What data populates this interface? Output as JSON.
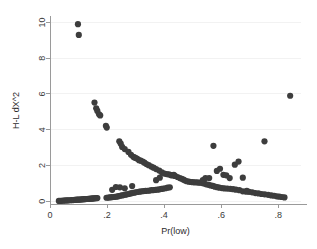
{
  "chart_data": {
    "type": "scatter",
    "title": "",
    "xlabel": "Pr(low)",
    "ylabel": "H-L dX^2",
    "xlim": [
      0,
      0.88
    ],
    "ylim": [
      -0.15,
      10.3
    ],
    "xticks": [
      0,
      0.2,
      0.4,
      0.6,
      0.8
    ],
    "xticklabels": [
      "0",
      ".2",
      ".4",
      ".6",
      ".8"
    ],
    "yticks": [
      0,
      2,
      4,
      6,
      8,
      10
    ],
    "yticklabels": [
      "0",
      "2",
      "4",
      "6",
      "8",
      "10"
    ],
    "grid": "faint-horizontal",
    "legend": "none",
    "marker_color": "#3d3d3d",
    "marker_size": 3.1,
    "series": [
      {
        "name": "H-L dX^2 vs Pr(low)",
        "points": [
          [
            0.098,
            9.9
          ],
          [
            0.101,
            9.3
          ],
          [
            0.842,
            5.9
          ],
          [
            0.156,
            5.52
          ],
          [
            0.162,
            5.2
          ],
          [
            0.166,
            5.05
          ],
          [
            0.172,
            4.86
          ],
          [
            0.176,
            4.8
          ],
          [
            0.196,
            4.22
          ],
          [
            0.199,
            4.12
          ],
          [
            0.243,
            3.35
          ],
          [
            0.248,
            3.22
          ],
          [
            0.253,
            3.04
          ],
          [
            0.262,
            2.92
          ],
          [
            0.275,
            2.76
          ],
          [
            0.284,
            2.6
          ],
          [
            0.292,
            2.49
          ],
          [
            0.296,
            2.45
          ],
          [
            0.301,
            2.42
          ],
          [
            0.306,
            2.38
          ],
          [
            0.312,
            2.3
          ],
          [
            0.318,
            2.27
          ],
          [
            0.325,
            2.22
          ],
          [
            0.331,
            2.16
          ],
          [
            0.338,
            2.08
          ],
          [
            0.346,
            2.02
          ],
          [
            0.355,
            1.94
          ],
          [
            0.363,
            1.88
          ],
          [
            0.372,
            1.8
          ],
          [
            0.383,
            1.72
          ],
          [
            0.392,
            1.62
          ],
          [
            0.401,
            1.55
          ],
          [
            0.409,
            1.52
          ],
          [
            0.417,
            1.5
          ],
          [
            0.424,
            1.47
          ],
          [
            0.431,
            1.45
          ],
          [
            0.438,
            1.42
          ],
          [
            0.447,
            1.36
          ],
          [
            0.455,
            1.3
          ],
          [
            0.462,
            1.26
          ],
          [
            0.468,
            1.21
          ],
          [
            0.474,
            1.16
          ],
          [
            0.48,
            1.12
          ],
          [
            0.487,
            1.1
          ],
          [
            0.494,
            1.08
          ],
          [
            0.5,
            1.07
          ],
          [
            0.507,
            1.06
          ],
          [
            0.514,
            1.06
          ],
          [
            0.52,
            1.05
          ],
          [
            0.527,
            1.04
          ],
          [
            0.534,
            1.02
          ],
          [
            0.541,
            0.99
          ],
          [
            0.548,
            0.95
          ],
          [
            0.556,
            0.92
          ],
          [
            0.563,
            0.89
          ],
          [
            0.571,
            0.86
          ],
          [
            0.578,
            0.82
          ],
          [
            0.586,
            0.79
          ],
          [
            0.594,
            0.76
          ],
          [
            0.603,
            0.74
          ],
          [
            0.612,
            0.72
          ],
          [
            0.622,
            0.71
          ],
          [
            0.632,
            0.7
          ],
          [
            0.642,
            0.68
          ],
          [
            0.652,
            0.65
          ],
          [
            0.664,
            0.62
          ],
          [
            0.676,
            0.56
          ],
          [
            0.688,
            0.54
          ],
          [
            0.698,
            0.53
          ],
          [
            0.709,
            0.5
          ],
          [
            0.72,
            0.46
          ],
          [
            0.731,
            0.44
          ],
          [
            0.742,
            0.41
          ],
          [
            0.753,
            0.39
          ],
          [
            0.765,
            0.36
          ],
          [
            0.776,
            0.33
          ],
          [
            0.786,
            0.31
          ],
          [
            0.795,
            0.28
          ],
          [
            0.804,
            0.26
          ],
          [
            0.813,
            0.24
          ],
          [
            0.822,
            0.22
          ],
          [
            0.031,
            0.02
          ],
          [
            0.036,
            0.03
          ],
          [
            0.041,
            0.03
          ],
          [
            0.046,
            0.04
          ],
          [
            0.051,
            0.04
          ],
          [
            0.056,
            0.05
          ],
          [
            0.061,
            0.05
          ],
          [
            0.066,
            0.06
          ],
          [
            0.071,
            0.06
          ],
          [
            0.076,
            0.07
          ],
          [
            0.081,
            0.07
          ],
          [
            0.086,
            0.08
          ],
          [
            0.09,
            0.08
          ],
          [
            0.094,
            0.09
          ],
          [
            0.098,
            0.09
          ],
          [
            0.102,
            0.1
          ],
          [
            0.106,
            0.1
          ],
          [
            0.11,
            0.11
          ],
          [
            0.114,
            0.11
          ],
          [
            0.118,
            0.12
          ],
          [
            0.122,
            0.12
          ],
          [
            0.126,
            0.13
          ],
          [
            0.13,
            0.13
          ],
          [
            0.134,
            0.14
          ],
          [
            0.138,
            0.14
          ],
          [
            0.142,
            0.15
          ],
          [
            0.146,
            0.15
          ],
          [
            0.15,
            0.16
          ],
          [
            0.154,
            0.16
          ],
          [
            0.158,
            0.17
          ],
          [
            0.162,
            0.18
          ],
          [
            0.166,
            0.18
          ],
          [
            0.198,
            0.2
          ],
          [
            0.204,
            0.21
          ],
          [
            0.21,
            0.22
          ],
          [
            0.216,
            0.23
          ],
          [
            0.222,
            0.24
          ],
          [
            0.228,
            0.25
          ],
          [
            0.234,
            0.26
          ],
          [
            0.24,
            0.29
          ],
          [
            0.246,
            0.31
          ],
          [
            0.252,
            0.33
          ],
          [
            0.258,
            0.35
          ],
          [
            0.264,
            0.37
          ],
          [
            0.27,
            0.39
          ],
          [
            0.276,
            0.41
          ],
          [
            0.282,
            0.44
          ],
          [
            0.288,
            0.46
          ],
          [
            0.294,
            0.48
          ],
          [
            0.3,
            0.5
          ],
          [
            0.307,
            0.52
          ],
          [
            0.314,
            0.54
          ],
          [
            0.321,
            0.56
          ],
          [
            0.328,
            0.57
          ],
          [
            0.335,
            0.58
          ],
          [
            0.342,
            0.59
          ],
          [
            0.349,
            0.6
          ],
          [
            0.356,
            0.62
          ],
          [
            0.363,
            0.63
          ],
          [
            0.37,
            0.64
          ],
          [
            0.377,
            0.65
          ],
          [
            0.384,
            0.67
          ],
          [
            0.391,
            0.69
          ],
          [
            0.398,
            0.71
          ],
          [
            0.405,
            0.73
          ],
          [
            0.412,
            0.76
          ],
          [
            0.42,
            0.78
          ],
          [
            0.218,
            0.64
          ],
          [
            0.231,
            0.8
          ],
          [
            0.245,
            0.78
          ],
          [
            0.262,
            0.73
          ],
          [
            0.288,
            0.85
          ],
          [
            0.372,
            1.18
          ],
          [
            0.385,
            1.32
          ],
          [
            0.425,
            1.45
          ],
          [
            0.434,
            1.48
          ],
          [
            0.573,
            3.1
          ],
          [
            0.585,
            1.7
          ],
          [
            0.596,
            1.82
          ],
          [
            0.608,
            1.48
          ],
          [
            0.618,
            1.45
          ],
          [
            0.63,
            1.3
          ],
          [
            0.648,
            2.05
          ],
          [
            0.661,
            2.22
          ],
          [
            0.676,
            1.32
          ],
          [
            0.69,
            0.58
          ],
          [
            0.752,
            3.35
          ],
          [
            0.536,
            1.18
          ],
          [
            0.545,
            1.3
          ],
          [
            0.558,
            1.3
          ]
        ]
      }
    ]
  },
  "axes": {
    "ylabel_text": "H-L dX^2",
    "xlabel_text": "Pr(low)"
  }
}
